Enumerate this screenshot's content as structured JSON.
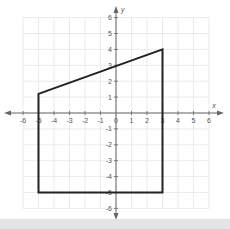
{
  "chart_data": {
    "type": "diagram",
    "title": "",
    "xlabel": "x",
    "ylabel": "y",
    "xlim": [
      -6,
      6
    ],
    "ylim": [
      -6,
      6
    ],
    "grid": true,
    "x_ticks": [
      "-6",
      "-5",
      "-4",
      "-3",
      "-2",
      "-1",
      "0",
      "1",
      "2",
      "3",
      "4",
      "5",
      "6"
    ],
    "y_ticks": [
      "6",
      "5",
      "4",
      "3",
      "2",
      "1",
      "-1",
      "-2",
      "-3",
      "-4",
      "-5",
      "-6"
    ],
    "shapes": [
      {
        "type": "polygon",
        "name": "quadrilateral",
        "vertices": [
          [
            -5,
            1.2
          ],
          [
            3,
            4
          ],
          [
            3,
            -5
          ],
          [
            -5,
            -5
          ]
        ],
        "stroke": "#222222"
      }
    ]
  },
  "colors": {
    "grid": "#e6e6e6",
    "axis": "#666666",
    "shape": "#222222",
    "label": "#555555",
    "band": "#e4e4e4"
  }
}
